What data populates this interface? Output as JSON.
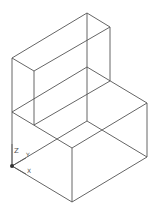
{
  "drawing": {
    "stroke_color": "#555555",
    "background": "#ffffff",
    "edges": [
      [
        12,
        58,
        87,
        13
      ],
      [
        87,
        13,
        110,
        27
      ],
      [
        110,
        27,
        34,
        71
      ],
      [
        34,
        71,
        12,
        58
      ],
      [
        12,
        58,
        12,
        112
      ],
      [
        34,
        71,
        34,
        125
      ],
      [
        87,
        13,
        87,
        121
      ],
      [
        110,
        27,
        110,
        81
      ],
      [
        12,
        112,
        87,
        67
      ],
      [
        87,
        67,
        147,
        103
      ],
      [
        147,
        103,
        72,
        148
      ],
      [
        72,
        148,
        12,
        112
      ],
      [
        12,
        112,
        12,
        166
      ],
      [
        72,
        148,
        72,
        202
      ],
      [
        147,
        103,
        147,
        157
      ],
      [
        12,
        166,
        72,
        202
      ],
      [
        72,
        202,
        147,
        157
      ],
      [
        34,
        125,
        110,
        81
      ]
    ],
    "hidden_edges": [
      [
        12,
        166,
        87,
        121
      ],
      [
        87,
        121,
        147,
        157
      ]
    ]
  },
  "ucs": {
    "z_label": "Z",
    "y_label": "Y",
    "x_label": "X",
    "origin": [
      12,
      166
    ]
  }
}
